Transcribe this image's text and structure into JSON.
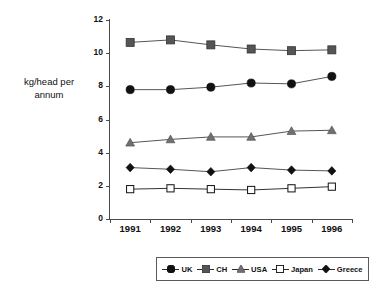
{
  "chart_data": {
    "type": "line",
    "title": "",
    "xlabel": "",
    "ylabel": "kg/head per annum",
    "categories": [
      "1991",
      "1992",
      "1993",
      "1994",
      "1995",
      "1996"
    ],
    "ylim": [
      0,
      12
    ],
    "yticks": [
      "0",
      "2",
      "4",
      "6",
      "8",
      "10",
      "12"
    ],
    "grid": false,
    "legend_position": "bottom",
    "series": [
      {
        "name": "UK",
        "marker": "filled-circle",
        "color": "#111111",
        "values": [
          7.8,
          7.8,
          7.95,
          8.2,
          8.15,
          8.6
        ]
      },
      {
        "name": "CH",
        "marker": "filled-square",
        "color": "#555555",
        "values": [
          10.65,
          10.8,
          10.5,
          10.25,
          10.15,
          10.2
        ]
      },
      {
        "name": "USA",
        "marker": "filled-triangle",
        "color": "#707070",
        "values": [
          4.6,
          4.8,
          4.95,
          4.95,
          5.3,
          5.35
        ]
      },
      {
        "name": "Japan",
        "marker": "open-square",
        "color": "#ffffff",
        "values": [
          1.8,
          1.85,
          1.8,
          1.75,
          1.85,
          1.95
        ]
      },
      {
        "name": "Greece",
        "marker": "filled-diamond",
        "color": "#111111",
        "values": [
          3.1,
          3.0,
          2.85,
          3.1,
          2.95,
          2.9
        ]
      }
    ]
  },
  "axis": {
    "y_title_line1": "kg/head per",
    "y_title_line2": "annum"
  },
  "legend": {
    "items": [
      {
        "label": "UK"
      },
      {
        "label": "CH"
      },
      {
        "label": "USA"
      },
      {
        "label": "Japan"
      },
      {
        "label": "Greece"
      }
    ]
  },
  "colors": {
    "axis": "#4a4a4a",
    "line": "#555555",
    "text": "#111111"
  }
}
